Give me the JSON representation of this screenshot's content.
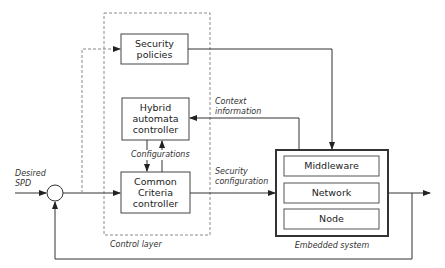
{
  "diagram": {
    "inputs": {
      "desired_spd": [
        "Desired",
        "SPD"
      ]
    },
    "control_layer": {
      "label": "Control layer",
      "blocks": {
        "security_policies": [
          "Security",
          "policies"
        ],
        "hybrid_automata_controller": [
          "Hybrid",
          "automata",
          "controller"
        ],
        "common_criteria_controller": [
          "Common",
          "Criteria",
          "controller"
        ]
      },
      "edge_labels": {
        "configurations": "Configurations"
      }
    },
    "edge_labels": {
      "context_information": [
        "Context",
        "information"
      ],
      "security_configuration": [
        "Security",
        "configuration"
      ]
    },
    "embedded_system": {
      "label": "Embedded system",
      "layers": [
        "Middleware",
        "Network",
        "Node"
      ]
    },
    "colors": {
      "line": "#333333",
      "dashed": "#888888",
      "box_border": "#444444"
    }
  }
}
